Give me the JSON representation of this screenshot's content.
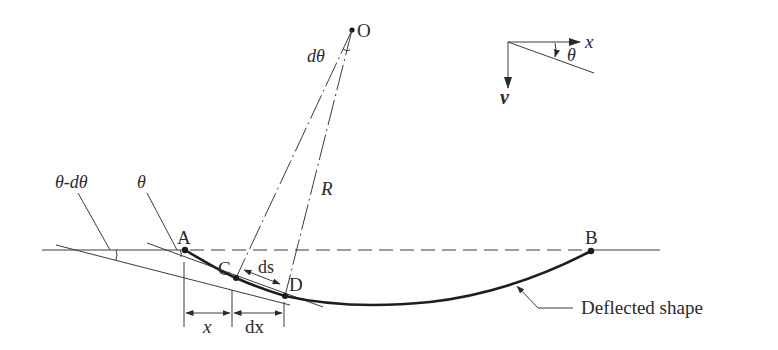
{
  "diagram": {
    "points": {
      "O": "O",
      "A": "A",
      "B": "B",
      "C": "C",
      "D": "D"
    },
    "labels": {
      "d_theta": "dθ",
      "radius": "R",
      "theta": "θ",
      "theta_minus_d_theta": "θ-dθ",
      "ds": "ds",
      "x": "x",
      "dx": "dx",
      "deflected_shape": "Deflected shape"
    },
    "axes": {
      "x_label": "x",
      "v_label": "v",
      "angle_label": "θ"
    },
    "colors": {
      "line": "#3a3a3a",
      "curve": "#1e1e1e",
      "background": "#ffffff"
    }
  }
}
